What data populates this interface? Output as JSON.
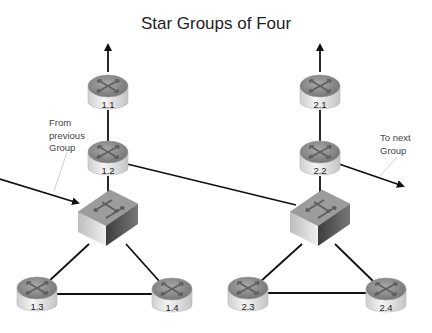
{
  "title": "Star Groups of Four",
  "annotations": {
    "from_previous": [
      "From",
      "previous",
      "Group"
    ],
    "to_next": [
      "To next",
      "Group"
    ]
  },
  "groups": [
    {
      "name": "group-1",
      "switch": {
        "x": 108,
        "y": 218
      },
      "routers": [
        {
          "id": "1.1",
          "x": 108,
          "y": 92
        },
        {
          "id": "1.2",
          "x": 108,
          "y": 158
        },
        {
          "id": "1.3",
          "x": 37,
          "y": 294
        },
        {
          "id": "1.4",
          "x": 172,
          "y": 295
        }
      ]
    },
    {
      "name": "group-2",
      "switch": {
        "x": 320,
        "y": 218
      },
      "routers": [
        {
          "id": "2.1",
          "x": 320,
          "y": 92
        },
        {
          "id": "2.2",
          "x": 320,
          "y": 158
        },
        {
          "id": "2.3",
          "x": 248,
          "y": 294
        },
        {
          "id": "2.4",
          "x": 386,
          "y": 295
        }
      ]
    }
  ],
  "colors": {
    "line": "#111111",
    "router_top": "#8a8a8a",
    "router_body": "#e6e6e6",
    "switch_top": "#9a9a9a",
    "switch_front": "#d4d4d4",
    "switch_side": "#555555"
  }
}
